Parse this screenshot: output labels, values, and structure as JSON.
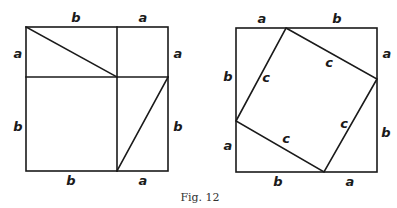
{
  "caption": "Fig. 12",
  "left_figure": {
    "labels": {
      "top_b": "b",
      "top_a": "a",
      "left_a": "a",
      "left_b": "b",
      "right_a": "a",
      "right_b": "b",
      "bottom_b": "b",
      "bottom_a": "a"
    }
  },
  "right_figure": {
    "labels": {
      "top_a": "a",
      "top_b": "b",
      "right_a": "a",
      "right_b": "b",
      "bottom_b": "b",
      "bottom_a": "a",
      "left_b": "b",
      "left_a": "a",
      "c_upper_left": "c",
      "c_upper_right": "c",
      "c_lower_right": "c",
      "c_lower_left": "c"
    }
  },
  "colors": {
    "line": "#1a1a1a",
    "background": "#ffffff"
  }
}
